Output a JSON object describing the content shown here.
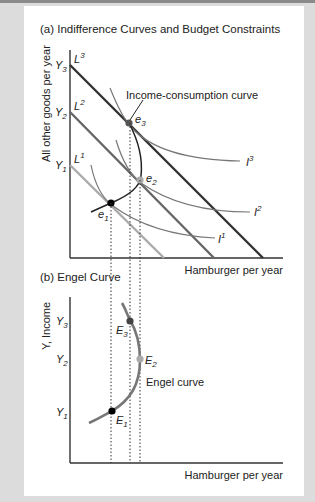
{
  "panel_a": {
    "title": "(a) Indifference Curves and Budget Constraints",
    "y_axis_label": "All other goods per year",
    "x_axis_label": "Hamburger per year",
    "y_ticks": [
      {
        "label": "Y",
        "sub": "3",
        "y": 65
      },
      {
        "label": "Y",
        "sub": "2",
        "y": 112
      },
      {
        "label": "Y",
        "sub": "1",
        "y": 165
      }
    ],
    "budget_lines": [
      {
        "label": "L",
        "sup": "3",
        "color": "#333333"
      },
      {
        "label": "L",
        "sup": "2",
        "color": "#666666"
      },
      {
        "label": "L",
        "sup": "1",
        "color": "#aaaaaa"
      }
    ],
    "indifference_curves": [
      {
        "label": "I",
        "sup": "3"
      },
      {
        "label": "I",
        "sup": "2"
      },
      {
        "label": "I",
        "sup": "1"
      }
    ],
    "equilibria": [
      {
        "label": "e",
        "sub": "1",
        "color": "#000000"
      },
      {
        "label": "e",
        "sub": "2",
        "color": "#aaaaaa"
      },
      {
        "label": "e",
        "sub": "3",
        "color": "#555555"
      }
    ],
    "icc_label": "Income-consumption curve"
  },
  "panel_b": {
    "title": "(b) Engel Curve",
    "y_axis_label": "Y, Income",
    "x_axis_label": "Hamburger per year",
    "y_ticks": [
      {
        "label": "Y",
        "sub": "3"
      },
      {
        "label": "Y",
        "sub": "2"
      },
      {
        "label": "Y",
        "sub": "1"
      }
    ],
    "points": [
      {
        "label": "E",
        "sub": "1",
        "color": "#000000"
      },
      {
        "label": "E",
        "sub": "2",
        "color": "#aaaaaa"
      },
      {
        "label": "E",
        "sub": "3",
        "color": "#555555"
      }
    ],
    "curve_label": "Engel curve"
  }
}
